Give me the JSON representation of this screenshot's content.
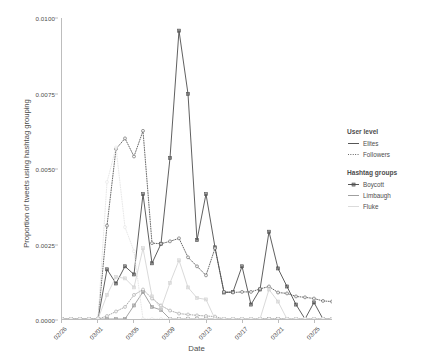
{
  "chart_data": {
    "type": "line",
    "title": "",
    "xlabel": "Date",
    "ylabel": "Proportion of tweets using hashtag grouping",
    "ylim": [
      0.0,
      0.01
    ],
    "ytick_labels": [
      "0.0000",
      "0.0025",
      "0.0050",
      "0.0075",
      "0.0100"
    ],
    "ytick_values": [
      0.0,
      0.0025,
      0.005,
      0.0075,
      0.01
    ],
    "grid": false,
    "legend_position": "right",
    "xtick_labels": [
      "02/26",
      "03/01",
      "03/05",
      "03/09",
      "03/13",
      "03/17",
      "03/21",
      "03/25"
    ],
    "xtick_indices": [
      0,
      4,
      8,
      12,
      16,
      20,
      24,
      28
    ],
    "x": [
      "02/26",
      "02/27",
      "02/28",
      "02/29",
      "03/01",
      "03/02",
      "03/03",
      "03/04",
      "03/05",
      "03/06",
      "03/07",
      "03/08",
      "03/09",
      "03/10",
      "03/11",
      "03/12",
      "03/13",
      "03/14",
      "03/15",
      "03/16",
      "03/17",
      "03/18",
      "03/19",
      "03/20",
      "03/21",
      "03/22",
      "03/23",
      "03/24",
      "03/25",
      "03/26",
      "03/27"
    ],
    "series": [
      {
        "name": "Boycott - Elites",
        "hashtag_group": "Boycott",
        "user_level": "Elites",
        "linestyle": "solid",
        "color": "#4d4d4d",
        "marker": "square",
        "values": [
          0.0,
          0.0,
          0.0,
          0.0,
          0.0,
          0.00165,
          0.00118,
          0.00175,
          0.00148,
          0.00415,
          0.00185,
          0.0025,
          0.00535,
          0.00958,
          0.00748,
          0.00262,
          0.00415,
          0.00238,
          0.00088,
          0.0009,
          0.00175,
          0.00048,
          0.00098,
          0.0029,
          0.00168,
          0.00108,
          0.00048,
          0.0,
          0.00055,
          0.0,
          0.0
        ]
      },
      {
        "name": "Boycott - Followers",
        "hashtag_group": "Boycott",
        "user_level": "Followers",
        "linestyle": "dotted",
        "color": "#4d4d4d",
        "marker": "circle",
        "values": [
          0.0,
          0.0,
          0.0,
          0.0,
          0.0,
          0.0031,
          0.00565,
          0.006,
          0.0054,
          0.00625,
          0.00252,
          0.0025,
          0.00258,
          0.00268,
          0.00205,
          0.00175,
          0.00145,
          0.00235,
          0.0009,
          0.00088,
          0.0009,
          0.0009,
          0.001,
          0.00108,
          0.00088,
          0.00085,
          0.00075,
          0.00072,
          0.00068,
          0.0006,
          0.00058
        ]
      },
      {
        "name": "Limbaugh - Elites",
        "hashtag_group": "Limbaugh",
        "user_level": "Elites",
        "linestyle": "solid",
        "color": "#9a9a9a",
        "marker": "square",
        "values": [
          0.0,
          0.0,
          0.0,
          0.0,
          0.0,
          0.0,
          0.0,
          0.0,
          0.00045,
          0.0009,
          0.0004,
          0.0003,
          0.0,
          0.0,
          0.0,
          0.0,
          0.0,
          0.0,
          0.0,
          0.0,
          0.0,
          0.0,
          0.0,
          0.0,
          0.0,
          0.0,
          0.0,
          0.0,
          0.0,
          0.0,
          0.0
        ]
      },
      {
        "name": "Limbaugh - Followers",
        "hashtag_group": "Limbaugh",
        "user_level": "Followers",
        "linestyle": "dotted",
        "color": "#9a9a9a",
        "marker": "circle",
        "values": [
          0.0,
          0.0,
          0.0,
          0.0,
          0.0,
          0.0001,
          0.00025,
          0.0004,
          0.0008,
          0.00098,
          0.00068,
          0.00045,
          0.00028,
          0.00018,
          0.00015,
          0.00012,
          0.0001,
          8e-05,
          0.0,
          0.0,
          0.0,
          0.0,
          0.0,
          0.0,
          0.0,
          0.0,
          0.0,
          0.0,
          0.0,
          0.0,
          0.0
        ]
      },
      {
        "name": "Fluke - Elites",
        "hashtag_group": "Fluke",
        "user_level": "Elites",
        "linestyle": "solid",
        "color": "#d4d4d4",
        "marker": "square",
        "values": [
          0.0,
          0.0,
          0.0,
          0.0,
          0.0,
          0.0008,
          0.0014,
          0.00135,
          0.00105,
          0.00235,
          0.00075,
          0.00035,
          0.0012,
          0.00195,
          0.00105,
          0.0007,
          0.00065,
          0.0,
          0.0,
          0.0,
          0.0,
          0.0,
          0.0,
          0.00098,
          0.00058,
          0.0,
          0.0,
          0.0,
          0.0,
          0.0,
          0.0
        ]
      },
      {
        "name": "Fluke - Followers",
        "hashtag_group": "Fluke",
        "user_level": "Followers",
        "linestyle": "dotted",
        "color": "#e3e3e3",
        "marker": "circle",
        "values": [
          0.0,
          0.0,
          0.0,
          0.0,
          0.0,
          0.00455,
          0.0057,
          0.00305,
          0.00225,
          0.0,
          0.0,
          0.0,
          0.0,
          0.0,
          0.0,
          0.0,
          0.0,
          0.0,
          0.0,
          0.0,
          0.0,
          0.0,
          0.0,
          0.0,
          0.0,
          0.0,
          0.0,
          0.0,
          0.0,
          0.0,
          0.0
        ]
      }
    ]
  },
  "legends": [
    {
      "name": "user-level",
      "title": "User level",
      "items": [
        {
          "label": "Elites",
          "linestyle": "solid",
          "color": "#4d4d4d"
        },
        {
          "label": "Followers",
          "linestyle": "dotted",
          "color": "#4d4d4d"
        }
      ]
    },
    {
      "name": "hashtag-groups",
      "title": "Hashtag groups",
      "items": [
        {
          "label": "Boycott",
          "color": "#4d4d4d",
          "marker": "square"
        },
        {
          "label": "Limbaugh",
          "color": "#9a9a9a",
          "marker": "none"
        },
        {
          "label": "Fluke",
          "color": "#d9d9d9",
          "marker": "none"
        }
      ]
    }
  ]
}
